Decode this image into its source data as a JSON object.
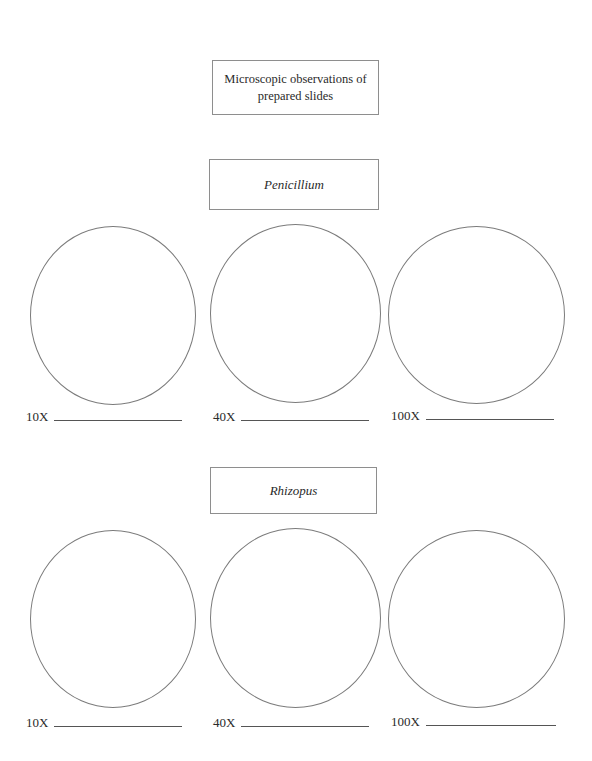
{
  "document": {
    "title": "Microscopic observations of prepared slides",
    "background_color": "#ffffff",
    "border_color": "#8e8e8e",
    "circle_border_color": "#7b7b7b",
    "rule_color": "#555555",
    "text_color": "#2a2a2a"
  },
  "sections": [
    {
      "name": "Penicillium",
      "specimens": [
        {
          "magnification": "10X",
          "drawing_area": "blank-circle",
          "answer_line": ""
        },
        {
          "magnification": "40X",
          "drawing_area": "blank-circle",
          "answer_line": ""
        },
        {
          "magnification": "100X",
          "drawing_area": "blank-circle",
          "answer_line": ""
        }
      ]
    },
    {
      "name": "Rhizopus",
      "specimens": [
        {
          "magnification": "10X",
          "drawing_area": "blank-circle",
          "answer_line": ""
        },
        {
          "magnification": "40X",
          "drawing_area": "blank-circle",
          "answer_line": ""
        },
        {
          "magnification": "100X",
          "drawing_area": "blank-circle",
          "answer_line": ""
        }
      ]
    }
  ]
}
